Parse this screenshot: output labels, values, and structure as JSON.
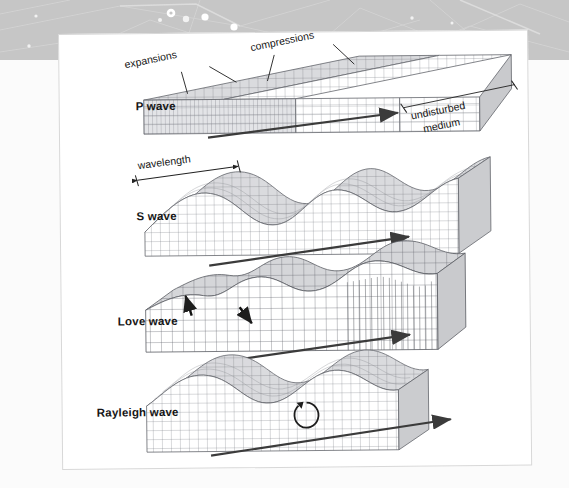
{
  "figure": {
    "title_text": "",
    "rows": [
      {
        "id": "p",
        "label": "P wave",
        "arrow": "propagation-arrow"
      },
      {
        "id": "s",
        "label": "S wave",
        "arrow": "propagation-arrow"
      },
      {
        "id": "love",
        "label": "Love wave",
        "arrow": "propagation-arrow"
      },
      {
        "id": "ray",
        "label": "Rayleigh wave",
        "arrow": "propagation-arrow"
      }
    ],
    "annotations": {
      "expansions": "expansions",
      "compressions": "compressions",
      "undisturbed_medium_line1": "undisturbed",
      "undisturbed_medium_line2": "medium",
      "wavelength": "wavelength"
    },
    "colors": {
      "background": "#fbfbfb",
      "band_grey": "#c6c6c6",
      "card_white": "#ffffff",
      "card_border": "#d8d8d8",
      "label_text": "#161616",
      "grid_line": "#6f7279",
      "arrow_dark": "#3b3b3b",
      "block_fill_light": "#ffffff",
      "block_fill_shade": "#d9dadd"
    }
  }
}
